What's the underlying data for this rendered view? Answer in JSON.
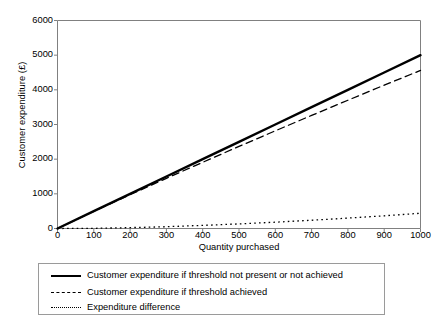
{
  "chart_data": {
    "type": "line",
    "title": "",
    "xlabel": "Quantity purchased",
    "ylabel": "Customer expenditure (£)",
    "xlim": [
      0,
      1000
    ],
    "ylim": [
      0,
      6000
    ],
    "xticks": [
      0,
      100,
      200,
      300,
      400,
      500,
      600,
      700,
      800,
      900,
      1000
    ],
    "yticks": [
      0,
      1000,
      2000,
      3000,
      4000,
      5000,
      6000
    ],
    "grid": false,
    "legend_position": "below-axes",
    "series": [
      {
        "name": "Customer expenditure if threshold not present or not achieved",
        "style": "solid",
        "width": 2.4,
        "color": "#000000",
        "x": [
          0,
          100,
          200,
          300,
          400,
          500,
          600,
          700,
          800,
          900,
          1000
        ],
        "values": [
          0,
          500,
          1000,
          1500,
          2000,
          2500,
          3000,
          3500,
          4000,
          4500,
          5000
        ]
      },
      {
        "name": "Customer expenditure if threshold achieved",
        "style": "dashed",
        "width": 1.3,
        "color": "#000000",
        "x": [
          0,
          100,
          200,
          300,
          400,
          500,
          600,
          700,
          800,
          900,
          1000
        ],
        "values": [
          0,
          495,
          975,
          1448,
          1910,
          2368,
          2818,
          3262,
          3700,
          4134,
          4560
        ]
      },
      {
        "name": "Expenditure difference",
        "style": "dotted",
        "width": 1.3,
        "color": "#000000",
        "x": [
          0,
          100,
          200,
          300,
          400,
          500,
          600,
          700,
          800,
          900,
          1000
        ],
        "values": [
          0,
          5,
          25,
          52,
          90,
          132,
          182,
          238,
          300,
          366,
          440
        ]
      }
    ]
  },
  "axes": {
    "y_label": "Customer expenditure (£)",
    "x_label": "Quantity purchased",
    "y_tick_labels": [
      "0",
      "1000",
      "2000",
      "3000",
      "4000",
      "5000",
      "6000"
    ],
    "x_tick_labels": [
      "0",
      "100",
      "200",
      "300",
      "400",
      "500",
      "600",
      "700",
      "800",
      "900",
      "1000"
    ]
  },
  "legend": {
    "entries": [
      {
        "label": "Customer expenditure if threshold not present or not achieved",
        "sample": "solid-line-sample"
      },
      {
        "label": "Customer expenditure if threshold achieved",
        "sample": "dashed-line-sample"
      },
      {
        "label": "Expenditure difference",
        "sample": "dotted-line-sample"
      }
    ]
  },
  "colors": {
    "line": "#000000",
    "axis": "#808080",
    "legend_border": "#9a9a9a",
    "background": "#ffffff"
  }
}
